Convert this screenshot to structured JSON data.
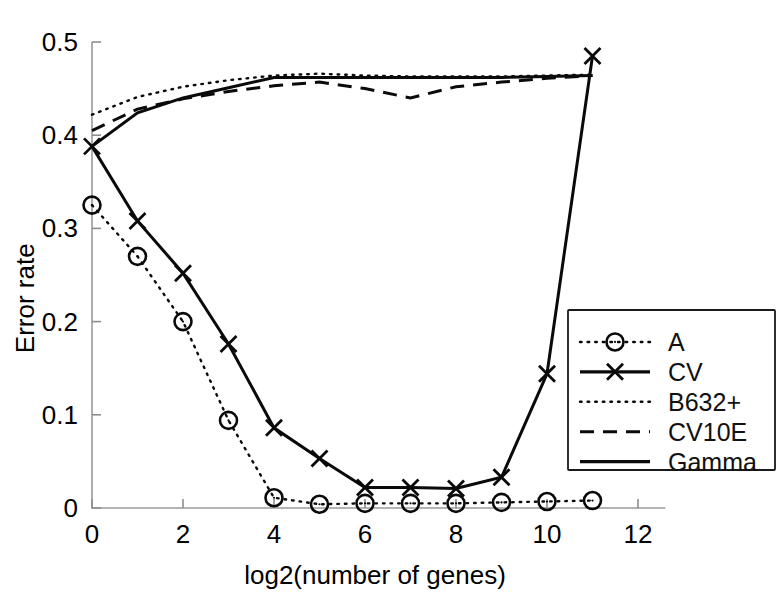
{
  "chart_data": {
    "type": "line",
    "title": "",
    "xlabel": "log2(number of genes)",
    "ylabel": "Error rate",
    "xlim": [
      0,
      12.6
    ],
    "ylim": [
      0,
      0.5
    ],
    "xticks": [
      0,
      2,
      4,
      6,
      8,
      10,
      12
    ],
    "xticklabels": [
      "0",
      "2",
      "4",
      "6",
      "8",
      "10",
      "12"
    ],
    "yticks": [
      0,
      0.1,
      0.2,
      0.3,
      0.4,
      0.5
    ],
    "yticklabels": [
      "0",
      "0.1",
      "0.2",
      "0.3",
      "0.4",
      "0.5"
    ],
    "grid": false,
    "legend_position": "lower right",
    "x": [
      0,
      1,
      2,
      3,
      4,
      5,
      6,
      7,
      8,
      9,
      10,
      11
    ],
    "series": [
      {
        "name": "A",
        "style": "dotted",
        "marker": "circle",
        "color": "#0a0a0a",
        "values": [
          0.325,
          0.27,
          0.2,
          0.094,
          0.011,
          0.004,
          0.005,
          0.005,
          0.005,
          0.006,
          0.007,
          0.008
        ]
      },
      {
        "name": "CV",
        "style": "solid",
        "marker": "x",
        "color": "#0a0a0a",
        "values": [
          0.388,
          0.308,
          0.252,
          0.176,
          0.086,
          0.053,
          0.022,
          0.022,
          0.021,
          0.033,
          0.144,
          0.485
        ]
      },
      {
        "name": "B632+",
        "style": "dotted",
        "marker": "none",
        "color": "#0a0a0a",
        "values": [
          0.422,
          0.441,
          0.452,
          0.459,
          0.464,
          0.466,
          0.464,
          0.463,
          0.463,
          0.463,
          0.464,
          0.465
        ]
      },
      {
        "name": "CV10E",
        "style": "dashed",
        "marker": "none",
        "color": "#0a0a0a",
        "values": [
          0.405,
          0.428,
          0.439,
          0.447,
          0.453,
          0.457,
          0.45,
          0.44,
          0.452,
          0.457,
          0.461,
          0.464
        ]
      },
      {
        "name": "Gamma",
        "style": "solid",
        "marker": "none",
        "color": "#0a0a0a",
        "values": [
          0.388,
          0.424,
          0.44,
          0.451,
          0.462,
          0.462,
          0.462,
          0.462,
          0.462,
          0.462,
          0.463,
          0.464
        ]
      }
    ],
    "legend": [
      {
        "label": "A",
        "style": "dotted",
        "marker": "circle"
      },
      {
        "label": "CV",
        "style": "solid",
        "marker": "x"
      },
      {
        "label": "B632+",
        "style": "dotted",
        "marker": "none"
      },
      {
        "label": "CV10E",
        "style": "dashed",
        "marker": "none"
      },
      {
        "label": "Gamma",
        "style": "solid",
        "marker": "none"
      }
    ]
  }
}
